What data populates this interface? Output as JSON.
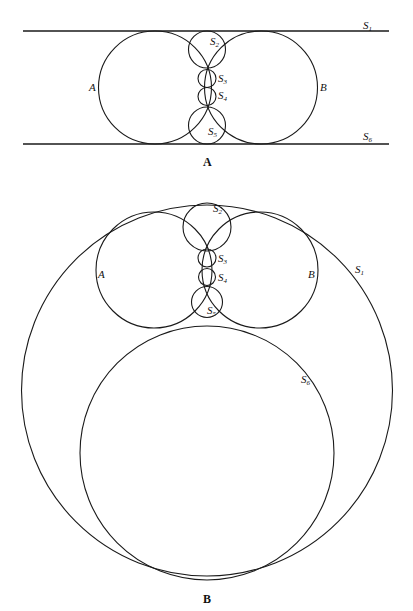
{
  "figure_a": {
    "caption": "A",
    "labels": {
      "S1": {
        "base": "S",
        "sub": "1"
      },
      "S2": {
        "base": "S",
        "sub": "2"
      },
      "S3": {
        "base": "S",
        "sub": "3"
      },
      "S4": {
        "base": "S",
        "sub": "4"
      },
      "S5": {
        "base": "S",
        "sub": "5"
      },
      "S6": {
        "base": "S",
        "sub": "6"
      },
      "A": "A",
      "B": "B"
    }
  },
  "figure_b": {
    "caption": "B",
    "labels": {
      "S1": {
        "base": "S",
        "sub": "1"
      },
      "S2": {
        "base": "S",
        "sub": "2"
      },
      "S3": {
        "base": "S",
        "sub": "3"
      },
      "S4": {
        "base": "S",
        "sub": "4"
      },
      "S5": {
        "base": "S",
        "sub": "5"
      },
      "S6": {
        "base": "S",
        "sub": "6"
      },
      "A": "A",
      "B": "B"
    }
  }
}
